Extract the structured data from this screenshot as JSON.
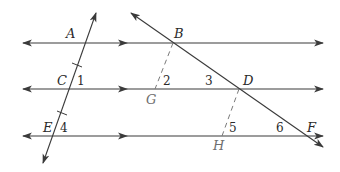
{
  "colors": {
    "line": "#3a3a3a",
    "dashed": "#7a7a7a",
    "label": "#2a2a2a",
    "label_gray": "#6f6f6f",
    "background": "#ffffff"
  },
  "points": {
    "A": "A",
    "B": "B",
    "C": "C",
    "D": "D",
    "E": "E",
    "F": "F",
    "G": "G",
    "H": "H"
  },
  "angles": {
    "a1": "1",
    "a2": "2",
    "a3": "3",
    "a4": "4",
    "a5": "5",
    "a6": "6"
  },
  "parallel_lines": [
    {
      "name": "line-AB",
      "y": 43
    },
    {
      "name": "line-CD",
      "y": 89
    },
    {
      "name": "line-EF",
      "y": 136
    }
  ],
  "transversals": [
    {
      "name": "transversal-ACE",
      "from": [
        96,
        13
      ],
      "to": [
        43,
        163
      ],
      "tick_marks": 2
    },
    {
      "name": "transversal-BDF",
      "from": [
        131,
        13
      ],
      "to": [
        323,
        147
      ]
    }
  ],
  "dashed_segments": [
    {
      "name": "segment-BG",
      "from": "B",
      "to": "G"
    },
    {
      "name": "segment-DH",
      "from": "D",
      "to": "H"
    }
  ]
}
